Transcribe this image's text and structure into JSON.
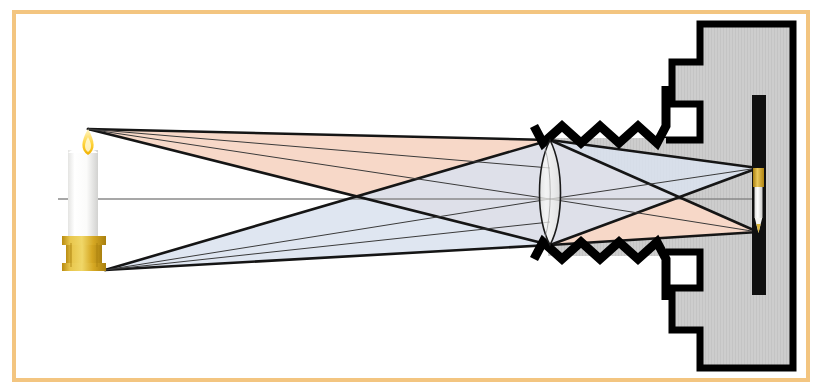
{
  "figure": {
    "canvas": {
      "width": 822,
      "height": 392,
      "background": "#ffffff"
    }
  },
  "frame": {
    "name": "decorative-border",
    "color": "#f3c580",
    "stroke_width": 4,
    "x": 14,
    "y": 12,
    "width": 794,
    "height": 368
  },
  "colors": {
    "upper_cone": "#f7d8c8",
    "lower_cone": "#d9e2ee",
    "cone_overlap": "#e8dde6",
    "ray_line": "#151515",
    "optical_axis": "#8a8a8a",
    "camera_body_fill": "#cdcdcd",
    "camera_body_stroke": "#000000",
    "film_strip": "#101010",
    "bellows": "#000000",
    "lens_glass": "#f2f2f0",
    "lens_outline": "#1a1a1a",
    "candle_wax": "#ffffff",
    "candle_wax_shade": "#dededc",
    "candle_holder": "#d8a520",
    "candle_holder_light": "#e9c54a",
    "flame_outer": "#f5c518",
    "flame_inner": "#fdf2b0",
    "wick": "#3a3028"
  },
  "object": {
    "name": "candle",
    "tip_point": {
      "x": 88,
      "y": 129
    },
    "base_point": {
      "x": 105,
      "y": 270
    },
    "body": {
      "x": 68,
      "y": 150,
      "width": 30,
      "height": 92
    },
    "holder": {
      "x": 62,
      "y": 238,
      "width": 44,
      "height": 34
    },
    "flame": {
      "x": 82,
      "y": 133,
      "width": 14,
      "height": 26
    }
  },
  "optical_axis": {
    "name": "optical-axis",
    "y": 199,
    "x_start": 58,
    "x_end": 762
  },
  "lens": {
    "name": "biconvex-lens",
    "center_x": 550,
    "top_y": 140,
    "bottom_y": 245,
    "half_width": 14
  },
  "bellows": {
    "name": "bellows-zigzag",
    "top": {
      "y": 131,
      "x_start": 534,
      "x_end": 668,
      "teeth": 7,
      "amplitude": 14
    },
    "bottom": {
      "y": 254,
      "x_start": 534,
      "x_end": 668,
      "teeth": 7,
      "amplitude": 14
    }
  },
  "camera_body": {
    "name": "camera-body",
    "outline_points": "700,24 793,24 793,368 700,368 700,330 672,330 672,288 700,288 700,252 660,252 660,140 700,140 700,104 672,104 672,62 700,62",
    "film": {
      "x": 752,
      "y": 95,
      "width": 14,
      "height": 200
    }
  },
  "image": {
    "name": "inverted-image",
    "description": "real inverted image of candle on film plane",
    "top_point": {
      "x": 758,
      "y": 168
    },
    "bottom_point": {
      "x": 758,
      "y": 232
    },
    "holder": {
      "x": 753,
      "y": 168,
      "width": 11,
      "height": 18
    },
    "body": {
      "x": 754,
      "y": 186,
      "width": 9,
      "height": 32
    },
    "flame": {
      "x": 756,
      "y": 218,
      "width": 6,
      "height": 14
    }
  },
  "ray_bundles": [
    {
      "name": "upper-ray-cone",
      "origin": "candle flame tip",
      "fill": "#f7d8c8",
      "source": {
        "x": 88,
        "y": 129
      },
      "lens_top": {
        "x": 550,
        "y": 140
      },
      "lens_bottom": {
        "x": 550,
        "y": 245
      },
      "image_point": {
        "x": 758,
        "y": 232
      }
    },
    {
      "name": "lower-ray-cone",
      "origin": "candle holder base",
      "fill": "#d9e2ee",
      "source": {
        "x": 105,
        "y": 270
      },
      "lens_top": {
        "x": 550,
        "y": 140
      },
      "lens_bottom": {
        "x": 550,
        "y": 245
      },
      "image_point": {
        "x": 758,
        "y": 168
      }
    }
  ],
  "chart_data": {
    "type": "diagram",
    "elements": [
      "candle (object)",
      "upper ray cone from flame tip",
      "lower ray cone from candle base",
      "optical axis",
      "biconvex lens",
      "bellows",
      "camera body",
      "film plane with inverted real image"
    ]
  }
}
